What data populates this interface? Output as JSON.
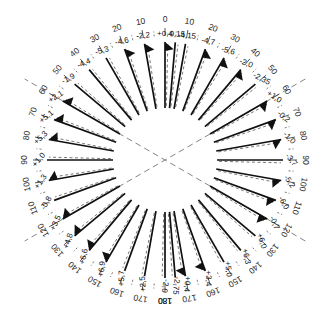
{
  "figure": {
    "center": {
      "x": 165,
      "y": 160
    },
    "radius_inner": 52,
    "radius_outer": 118,
    "radius_scale_ticks": 124,
    "radius_scale_text": 140,
    "radius_value_text": 126,
    "colors": {
      "solid_curve": "#111111",
      "dashed_curve": "#555555",
      "axis_dashed": "#777777",
      "tick": "#444444",
      "text": "#111111",
      "background": "#ffffff"
    },
    "axes_diagonal": [
      {
        "name": "diagonal-axis-a",
        "angle_deg": 60
      },
      {
        "name": "diagonal-axis-b",
        "angle_deg": 120
      }
    ]
  },
  "chart_data": {
    "type": "line",
    "plot_style": "polar-radial-spokes",
    "title": "",
    "xlabel": "Azimuth (degrees)",
    "ylabel": "Deviation",
    "grid": false,
    "legend": [],
    "angle_unit": "deg",
    "angle_convention": "0 at top, increasing both clockwise and counter-clockwise to 180 at bottom",
    "tick_labels_right": [
      "0",
      "10",
      "20",
      "30",
      "40",
      "50",
      "60",
      "70",
      "80",
      "90",
      "100",
      "110",
      "120",
      "130",
      "140",
      "150",
      "160",
      "170",
      "180"
    ],
    "tick_labels_left": [
      "0",
      "10",
      "20",
      "30",
      "40",
      "50",
      "60",
      "70",
      "80",
      "90",
      "100",
      "110",
      "120",
      "130",
      "140",
      "150",
      "160",
      "170",
      "180"
    ],
    "categories": [
      "0R",
      "10R",
      "20R",
      "30R",
      "40R",
      "50R",
      "60R",
      "70R",
      "80R",
      "90R",
      "100R",
      "110R",
      "120R",
      "130R",
      "140R",
      "150R",
      "160R",
      "170R",
      "180R",
      "170L",
      "160L",
      "150L",
      "140L",
      "130L",
      "120L",
      "110L",
      "100L",
      "90L",
      "80L",
      "70L",
      "60L",
      "50L",
      "40L",
      "30L",
      "20L",
      "10L"
    ],
    "values": [
      -0.15,
      -4.15,
      -4.7,
      -5.6,
      -2.0,
      -2.35,
      1.0,
      -0.2,
      -1.0,
      -3.7,
      -5.2,
      -6.0,
      -0.7,
      6.0,
      6.3,
      5.0,
      3.4,
      0.4,
      -2.75,
      -2.0,
      2.5,
      5.7,
      6.9,
      6.6,
      4.8,
      3.5,
      -0.8,
      1.3,
      1.0,
      5.3,
      5.1,
      2.1,
      -1.9,
      -4.4,
      -5.3,
      -4.6
    ],
    "series": [
      {
        "name": "measured",
        "style": "solid",
        "values": [
          -0.15,
          -4.15,
          -4.7,
          -5.6,
          -2.0,
          -2.35,
          1.0,
          -0.2,
          -1.0,
          -3.7,
          -5.2,
          -6.0,
          -0.7,
          6.0,
          6.3,
          5.0,
          3.4,
          0.4,
          -2.75,
          -2.0,
          2.5,
          5.7,
          6.9,
          6.6,
          4.8,
          3.5,
          -0.8,
          1.3,
          1.0,
          5.3,
          5.1,
          2.1,
          -1.9,
          -4.4,
          -5.3,
          -4.6
        ]
      },
      {
        "name": "reference",
        "style": "dashed",
        "values": [
          -0.15,
          -4.15,
          -4.7,
          -5.6,
          -2.0,
          -2.35,
          1.0,
          -0.2,
          -1.0,
          -3.7,
          -5.2,
          -6.0,
          -0.7,
          6.0,
          6.3,
          5.0,
          3.4,
          0.4,
          -2.75,
          -2.0,
          2.5,
          5.7,
          6.9,
          6.6,
          4.8,
          3.5,
          -0.8,
          1.3,
          1.0,
          5.3,
          5.1,
          2.1,
          -1.9,
          -4.4,
          -5.3,
          -4.6
        ]
      }
    ],
    "annotations": [
      {
        "name": "value-0-top",
        "text": "+0.4",
        "angle_deg": -5
      },
      {
        "name": "value-0r",
        "text": "-0.15",
        "angle_deg": 5
      }
    ]
  },
  "spokes": [
    {
      "angle": 0,
      "label": "+0,4",
      "side": "left",
      "arrow": true
    },
    {
      "angle": -10,
      "label": "-2,2",
      "side": "left",
      "arrow": true
    },
    {
      "angle": -20,
      "label": "-4,6",
      "side": "left",
      "arrow": true
    },
    {
      "angle": -30,
      "label": "-5,3",
      "side": "left",
      "arrow": false
    },
    {
      "angle": -40,
      "label": "-4,4",
      "side": "left",
      "arrow": false
    },
    {
      "angle": -50,
      "label": "-1,9",
      "side": "left",
      "arrow": false
    },
    {
      "angle": -60,
      "label": "+2,1",
      "side": "left",
      "arrow": true
    },
    {
      "angle": -70,
      "label": "+5,1",
      "side": "left",
      "arrow": true
    },
    {
      "angle": -80,
      "label": "+5,3",
      "side": "left",
      "arrow": true
    },
    {
      "angle": -90,
      "label": "+1,0",
      "side": "left",
      "arrow": false
    },
    {
      "angle": -100,
      "label": "+1,3",
      "side": "left",
      "arrow": true
    },
    {
      "angle": -110,
      "label": "-0,8",
      "side": "left",
      "arrow": false
    },
    {
      "angle": -120,
      "label": "+3,5",
      "side": "left",
      "arrow": true
    },
    {
      "angle": -130,
      "label": "+4,8",
      "side": "left",
      "arrow": true
    },
    {
      "angle": -140,
      "label": "+6,6",
      "side": "left",
      "arrow": true
    },
    {
      "angle": -150,
      "label": "+6,9",
      "side": "left",
      "arrow": true
    },
    {
      "angle": -160,
      "label": "+5,7",
      "side": "left",
      "arrow": false
    },
    {
      "angle": -170,
      "label": "+2,5",
      "side": "left",
      "arrow": false
    },
    {
      "angle": 180,
      "label": "-2,0",
      "side": "left",
      "arrow": false
    },
    {
      "angle": 175,
      "label": "-2,75",
      "side": "right",
      "arrow": false
    },
    {
      "angle": 170,
      "label": "+0,4",
      "side": "right",
      "arrow": true
    },
    {
      "angle": 160,
      "label": "+3,4",
      "side": "right",
      "arrow": true
    },
    {
      "angle": 150,
      "label": "+5,0",
      "side": "right",
      "arrow": false
    },
    {
      "angle": 140,
      "label": "+6,3",
      "side": "right",
      "arrow": false
    },
    {
      "angle": 130,
      "label": "+6,0",
      "side": "right",
      "arrow": false
    },
    {
      "angle": 120,
      "label": "-0,7",
      "side": "right",
      "arrow": true
    },
    {
      "angle": 110,
      "label": "-6,0",
      "side": "right",
      "arrow": true
    },
    {
      "angle": 100,
      "label": "-5,2",
      "side": "right",
      "arrow": true
    },
    {
      "angle": 90,
      "label": "-3,7",
      "side": "right",
      "arrow": false
    },
    {
      "angle": 80,
      "label": "-1,0",
      "side": "right",
      "arrow": true
    },
    {
      "angle": 70,
      "label": "-0,2",
      "side": "right",
      "arrow": true
    },
    {
      "angle": 60,
      "label": "+1,0",
      "side": "right",
      "arrow": true
    },
    {
      "angle": 50,
      "label": "-2,35",
      "side": "right",
      "arrow": false
    },
    {
      "angle": 40,
      "label": "-2,0",
      "side": "right",
      "arrow": true
    },
    {
      "angle": 30,
      "label": "-5,6",
      "side": "right",
      "arrow": true
    },
    {
      "angle": 20,
      "label": "-4,7",
      "side": "right",
      "arrow": true
    },
    {
      "angle": 10,
      "label": "-4,15",
      "side": "right",
      "arrow": false
    },
    {
      "angle": 5,
      "label": "-0,15",
      "side": "right",
      "arrow": false
    }
  ],
  "scale": {
    "major_step_deg": 10,
    "minor_step_deg": 5,
    "right": [
      "0",
      "10",
      "20",
      "30",
      "40",
      "50",
      "60",
      "70",
      "80",
      "90",
      "100",
      "110",
      "120",
      "130",
      "140",
      "150",
      "160",
      "170",
      "180"
    ],
    "left": [
      "10",
      "20",
      "30",
      "40",
      "50",
      "60",
      "70",
      "80",
      "90",
      "100",
      "110",
      "120",
      "130",
      "140",
      "150",
      "160",
      "170",
      "180"
    ]
  }
}
